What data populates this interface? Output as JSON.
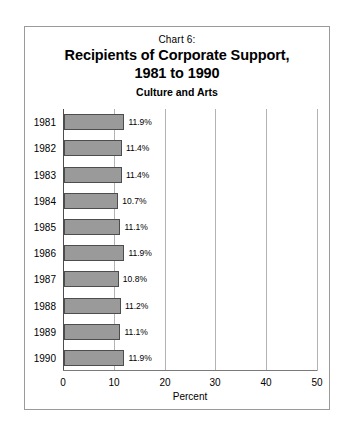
{
  "figure": {
    "chart_number": "Chart 6:",
    "title_line1": "Recipients of Corporate Support,",
    "title_line2": "1981 to 1990",
    "subtitle": "Culture and Arts",
    "bar_color": "#9a9a9a",
    "bar_edge_color": "#4d4d4d",
    "border_color": "#9a9a9a",
    "grid_color": "#b3b3b3"
  },
  "chart_data": {
    "type": "bar",
    "orientation": "horizontal",
    "title": "Chart 6: Recipients of Corporate Support, 1981 to 1990",
    "subtitle": "Culture and Arts",
    "xlabel": "Percent",
    "ylabel": "",
    "categories": [
      "1981",
      "1982",
      "1983",
      "1984",
      "1985",
      "1986",
      "1987",
      "1988",
      "1989",
      "1990"
    ],
    "values": [
      11.9,
      11.4,
      11.4,
      10.7,
      11.1,
      11.9,
      10.8,
      11.2,
      11.1,
      11.9
    ],
    "value_labels": [
      "11.9%",
      "11.4%",
      "11.4%",
      "10.7%",
      "11.1%",
      "11.9%",
      "10.8%",
      "11.2%",
      "11.1%",
      "11.9%"
    ],
    "xlim": [
      0,
      50
    ],
    "xticks": [
      0,
      10,
      20,
      30,
      40,
      50
    ],
    "xticklabels": [
      "0",
      "10",
      "20",
      "30",
      "40",
      "50"
    ],
    "grid": "vertical",
    "legend": null
  }
}
